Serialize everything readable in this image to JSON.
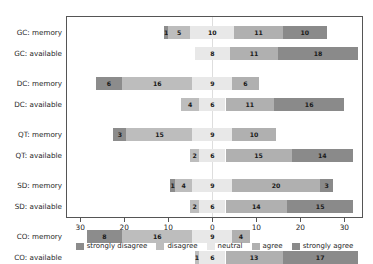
{
  "chart_data": {
    "type": "bar",
    "subtype": "diverging-stacked-likert",
    "title": "",
    "subtitle": "",
    "xlabel": "",
    "ylabel": "",
    "xlim": [
      -33,
      34
    ],
    "grid": false,
    "legend_position": "bottom",
    "xticks": [
      {
        "value": -30,
        "label": "30"
      },
      {
        "value": -20,
        "label": "20"
      },
      {
        "value": -10,
        "label": "10"
      },
      {
        "value": 0,
        "label": "0"
      },
      {
        "value": 10,
        "label": "10"
      },
      {
        "value": 20,
        "label": "20"
      },
      {
        "value": 30,
        "label": "30"
      }
    ],
    "categories": [
      "GC: memory",
      "GC: available",
      "DC: memory",
      "DC: available",
      "QT: memory",
      "QT: available",
      "SD: memory",
      "SD: available",
      "CO: memory",
      "CO: available"
    ],
    "series": [
      {
        "name": "strongly disagree",
        "color": "#8c8c8c",
        "values": [
          1,
          0,
          6,
          0,
          3,
          0,
          1,
          0,
          8,
          0
        ]
      },
      {
        "name": "disagree",
        "color": "#bdbdbd",
        "values": [
          5,
          0,
          16,
          4,
          15,
          2,
          4,
          2,
          16,
          1
        ]
      },
      {
        "name": "neutral",
        "color": "#e8e8e8",
        "values": [
          10,
          8,
          9,
          6,
          9,
          6,
          9,
          6,
          9,
          6
        ]
      },
      {
        "name": "agree",
        "color": "#b0b0b0",
        "values": [
          11,
          11,
          6,
          11,
          10,
          15,
          20,
          14,
          4,
          13
        ]
      },
      {
        "name": "strongly agree",
        "color": "#8a8a8a",
        "values": [
          10,
          18,
          0,
          16,
          0,
          14,
          3,
          15,
          0,
          17
        ]
      }
    ],
    "rows": [
      {
        "category": "GC: memory",
        "strongly disagree": 1,
        "disagree": 5,
        "neutral": 10,
        "agree": 11,
        "strongly agree": 10
      },
      {
        "category": "GC: available",
        "strongly disagree": 0,
        "disagree": 0,
        "neutral": 8,
        "agree": 11,
        "strongly agree": 18
      },
      {
        "category": "DC: memory",
        "strongly disagree": 6,
        "disagree": 16,
        "neutral": 9,
        "agree": 6,
        "strongly agree": 0
      },
      {
        "category": "DC: available",
        "strongly disagree": 0,
        "disagree": 4,
        "neutral": 6,
        "agree": 11,
        "strongly agree": 16
      },
      {
        "category": "QT: memory",
        "strongly disagree": 3,
        "disagree": 15,
        "neutral": 9,
        "agree": 10,
        "strongly agree": 0
      },
      {
        "category": "QT: available",
        "strongly disagree": 0,
        "disagree": 2,
        "neutral": 6,
        "agree": 15,
        "strongly agree": 14
      },
      {
        "category": "SD: memory",
        "strongly disagree": 1,
        "disagree": 4,
        "neutral": 9,
        "agree": 20,
        "strongly agree": 3
      },
      {
        "category": "SD: available",
        "strongly disagree": 0,
        "disagree": 2,
        "neutral": 6,
        "agree": 14,
        "strongly agree": 15
      },
      {
        "category": "CO: memory",
        "strongly disagree": 8,
        "disagree": 16,
        "neutral": 9,
        "agree": 4,
        "strongly agree": 0
      },
      {
        "category": "CO: available",
        "strongly disagree": 0,
        "disagree": 1,
        "neutral": 6,
        "agree": 13,
        "strongly agree": 17
      }
    ],
    "legend": [
      "strongly disagree",
      "disagree",
      "neutral",
      "agree",
      "strongly agree"
    ]
  },
  "colors": {
    "strongly_disagree": "#8c8c8c",
    "disagree": "#bdbdbd",
    "neutral": "#e8e8e8",
    "agree": "#b0b0b0",
    "strongly_agree": "#8a8a8a",
    "frame": "#555555",
    "zero_line": "#dedede",
    "background": "#ffffff",
    "text": "#262626"
  }
}
